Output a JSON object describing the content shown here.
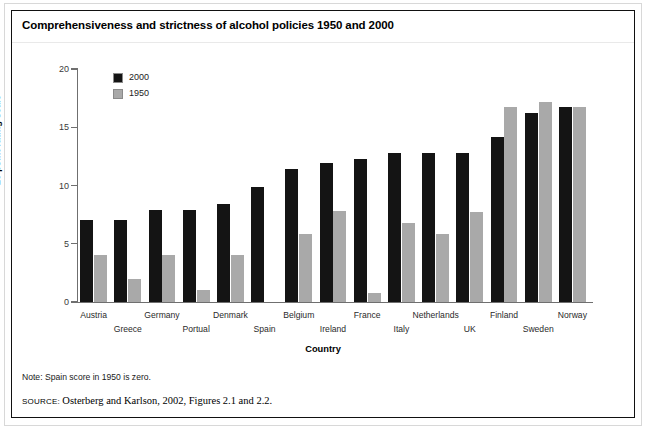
{
  "figure": {
    "title": "Comprehensiveness and strictness of alcohol policies 1950 and 2000",
    "note": "Note:  Spain score in 1950 is zero.",
    "source_label": "source:",
    "source_text": "Osterberg and Karlson, 2002, Figures 2.1 and 2.2."
  },
  "colors": {
    "series_2000": "#141414",
    "series_1950": "#a9a9a9",
    "axis": "#6f6f6f",
    "frame": "#111111"
  },
  "chart_data": {
    "type": "bar",
    "title": "Comprehensiveness and strictness of alcohol policies 1950 and 2000",
    "xlabel": "Country",
    "ylabel": "20 point rating scale",
    "ylim": [
      0,
      20
    ],
    "yticks": [
      0,
      5,
      10,
      15,
      20
    ],
    "ytick_labels": [
      "0",
      "5",
      "10",
      "15",
      "20"
    ],
    "grid": false,
    "legend_position": "top-left inside axes",
    "categories": [
      "Austria",
      "Greece",
      "Germany",
      "Portual",
      "Denmark",
      "Spain",
      "Belgium",
      "Ireland",
      "France",
      "Italy",
      "Netherlands",
      "UK",
      "Finland",
      "Sweden",
      "Norway"
    ],
    "series": [
      {
        "name": "2000",
        "color": "#141414",
        "values": [
          7.0,
          7.0,
          7.9,
          7.9,
          8.4,
          9.9,
          11.4,
          11.9,
          12.3,
          12.8,
          12.8,
          12.8,
          14.2,
          16.2,
          16.7
        ]
      },
      {
        "name": "1950",
        "color": "#a9a9a9",
        "values": [
          4.0,
          2.0,
          4.0,
          1.0,
          4.0,
          0.0,
          5.8,
          7.8,
          0.8,
          6.8,
          5.8,
          7.7,
          16.7,
          17.2,
          16.7
        ]
      }
    ],
    "annotations": [
      "Spain score in 1950 is zero."
    ]
  }
}
